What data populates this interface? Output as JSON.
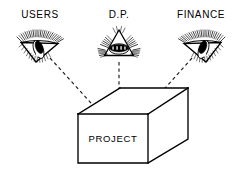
{
  "figure": {
    "background_color": "#ffffff",
    "line_color": "#000000",
    "width": 239,
    "height": 178
  },
  "viewpoints": [
    {
      "id": "users",
      "label": "USERS",
      "icon": "eye-icon",
      "position": "left",
      "sight_line": "dashed"
    },
    {
      "id": "dp",
      "label": "D.P.",
      "icon": "eye-icon",
      "position": "center",
      "sight_line": "dashed"
    },
    {
      "id": "finance",
      "label": "FINANCE",
      "icon": "eye-icon",
      "position": "right",
      "sight_line": "dashed"
    }
  ],
  "box": {
    "label": "PROJECT",
    "shape": "open-isometric-box",
    "fill_color": "#ffffff",
    "stroke_color": "#000000"
  }
}
